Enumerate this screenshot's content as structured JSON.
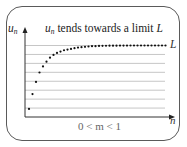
{
  "figure": {
    "title_var": "u",
    "title_sub": "n",
    "title_text": " tends towards a limit ",
    "title_limit": "L",
    "ylabel_var": "u",
    "ylabel_sub": "n",
    "xlabel": "n",
    "limit_label": "L",
    "condition": "0 < m < 1"
  },
  "chart_data": {
    "type": "scatter",
    "xlabel": "n",
    "ylabel": "u_n",
    "annotation": "0 < m < 1",
    "limit_label": "L",
    "limit_value": 1.0,
    "grid": true,
    "grid_orientation": "horizontal",
    "axis_ticks": "none",
    "x": [
      1,
      2,
      3,
      4,
      5,
      6,
      7,
      8,
      9,
      10,
      11,
      12,
      13,
      14,
      15,
      16,
      17,
      18,
      19,
      20,
      21,
      22,
      23,
      24,
      25,
      26,
      27,
      28,
      29,
      30,
      31,
      32,
      33,
      34,
      35,
      36,
      37,
      38,
      39,
      40
    ],
    "values": [
      0.06,
      0.28,
      0.46,
      0.6,
      0.69,
      0.76,
      0.82,
      0.86,
      0.89,
      0.91,
      0.93,
      0.94,
      0.95,
      0.96,
      0.97,
      0.975,
      0.98,
      0.985,
      0.99,
      0.99,
      0.993,
      0.995,
      0.996,
      0.997,
      0.998,
      0.998,
      0.999,
      0.999,
      0.999,
      1.0,
      1.0,
      1.0,
      1.0,
      1.0,
      1.0,
      1.0,
      1.0,
      1.0,
      1.0,
      1.0
    ],
    "ylim": [
      0,
      1.0
    ],
    "gridlines_count": 8,
    "colors": {
      "points": "#111111",
      "grid": "#b8b8b8",
      "axes": "#333333",
      "border": "#5a5a5a",
      "annotation": "#666666"
    }
  }
}
